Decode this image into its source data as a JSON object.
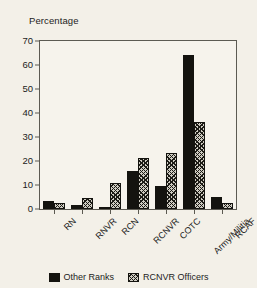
{
  "chart_data": {
    "type": "bar",
    "title": "",
    "ylabel": "Percentage",
    "xlabel": "",
    "ylim": [
      0,
      70
    ],
    "yticks": [
      0,
      10,
      20,
      30,
      40,
      50,
      60,
      70
    ],
    "grid": false,
    "legend_position": "bottom",
    "categories": [
      "RN",
      "RNVR",
      "RCN",
      "RCNVR",
      "COTC",
      "Army/Militia",
      "RCAF"
    ],
    "series": [
      {
        "name": "Other Ranks",
        "style": "solid-black",
        "color": "#14130f",
        "values": [
          3.2,
          1.7,
          0.7,
          16.0,
          9.5,
          64.3,
          5.2
        ]
      },
      {
        "name": "RCNVR Officers",
        "style": "cross-hatch",
        "color": "#cfccc2",
        "values": [
          2.4,
          4.4,
          10.7,
          21.4,
          23.5,
          36.4,
          2.4
        ]
      }
    ]
  },
  "legend": {
    "items": [
      {
        "label": "Other Ranks",
        "swatch": "solid"
      },
      {
        "label": "RCNVR Officers",
        "swatch": "hatch"
      }
    ]
  },
  "axes": {
    "y_title": "Percentage"
  }
}
